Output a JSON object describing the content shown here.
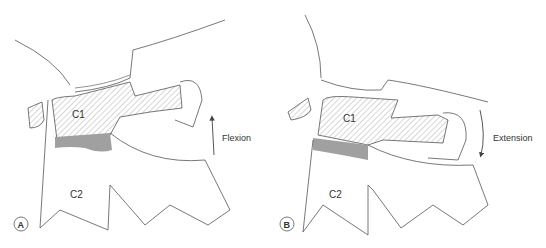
{
  "panels": [
    {
      "badge": "A",
      "upper_label": "C1",
      "lower_label": "C2",
      "motion_label": "Flexion",
      "arrow_direction": "up"
    },
    {
      "badge": "B",
      "upper_label": "C1",
      "lower_label": "C2",
      "motion_label": "Extension",
      "arrow_direction": "down"
    }
  ],
  "colors": {
    "line": "#555555",
    "disc": "#a0a0a0",
    "hatch": "#888888"
  }
}
